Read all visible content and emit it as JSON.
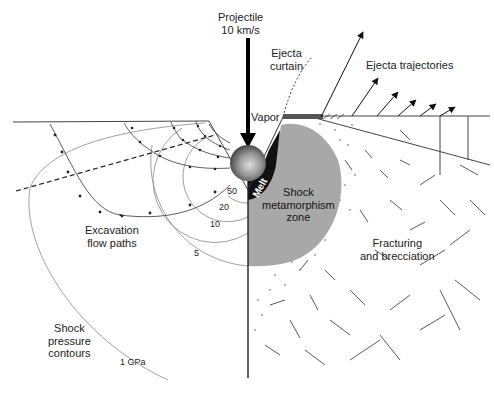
{
  "diagram": {
    "labels": {
      "projectile": [
        "Projectile",
        "10 km/s"
      ],
      "ejecta_curtain": [
        "Ejecta",
        "curtain"
      ],
      "ejecta_trajectories": "Ejecta trajectories",
      "vapor": "Vapor",
      "melt": "Melt",
      "shock_zone": [
        "Shock",
        "metamorphism",
        "zone"
      ],
      "fracturing": [
        "Fracturing",
        "and brecciation"
      ],
      "excavation": [
        "Excavation",
        "flow paths"
      ],
      "shock_contours": [
        "Shock",
        "pressure",
        "contours"
      ]
    },
    "pressure_contours": [
      {
        "label": "50",
        "value": 50
      },
      {
        "label": "20",
        "value": 20
      },
      {
        "label": "10",
        "value": 10
      },
      {
        "label": "5",
        "value": 5
      },
      {
        "label": "1 GPa",
        "value": 1
      }
    ],
    "colors": {
      "shock_zone": "#a8a8a8",
      "melt": "#111111",
      "lines": "#333333",
      "contours": "#777777"
    }
  }
}
